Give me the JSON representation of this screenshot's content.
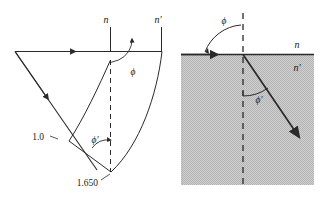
{
  "figure": {
    "background_color": "#ffffff",
    "stroke_color": "#2a2a2a",
    "shade_color": "#c9c9c9"
  },
  "left_panel": {
    "name": "huygens-wavefront-construction",
    "labels": {
      "normal_n": "n",
      "normal_n_prime": "n′",
      "radius_outer": "1.0",
      "radius_inner": "1.650",
      "angle_incidence": "ϕ",
      "angle_refraction": "ϕ′"
    }
  },
  "right_panel": {
    "name": "ray-refraction-diagram",
    "labels": {
      "medium_above": "n",
      "medium_below": "n′",
      "angle_incidence": "ϕ",
      "angle_refraction": "ϕ′"
    }
  }
}
